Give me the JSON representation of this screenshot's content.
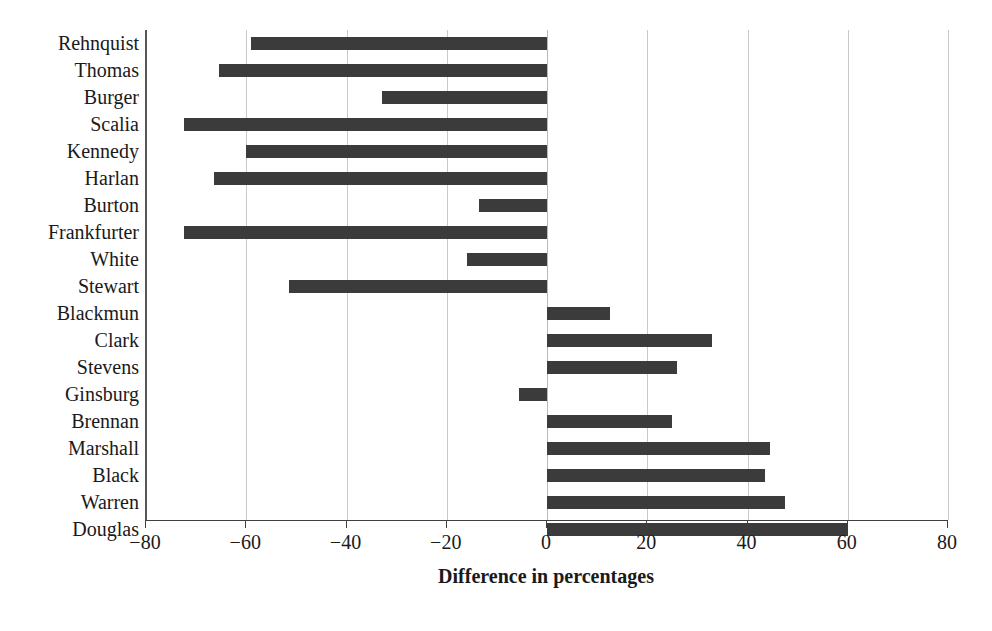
{
  "chart_data": {
    "type": "bar",
    "orientation": "horizontal",
    "title": "",
    "xlabel": "Difference in percentages",
    "ylabel": "",
    "xlim": [
      -80,
      80
    ],
    "xticks": [
      -80,
      -60,
      -40,
      -20,
      0,
      20,
      40,
      60,
      80
    ],
    "xtick_labels": [
      "−80",
      "−60",
      "−40",
      "−20",
      "0",
      "20",
      "40",
      "60",
      "80"
    ],
    "grid": "vertical",
    "legend": "none",
    "bar_color": "#3b3b3b",
    "categories": [
      "Rehnquist",
      "Thomas",
      "Burger",
      "Scalia",
      "Kennedy",
      "Harlan",
      "Burton",
      "Frankfurter",
      "White",
      "Stewart",
      "Blackmun",
      "Clark",
      "Stevens",
      "Ginsburg",
      "Brennan",
      "Marshall",
      "Black",
      "Warren",
      "Douglas"
    ],
    "values": [
      -59,
      -65.5,
      -33,
      -72.5,
      -60,
      -66.5,
      -13.5,
      -72.5,
      -16,
      -51.5,
      12.5,
      33,
      26,
      -5.5,
      25,
      44.5,
      43.5,
      47.5,
      60
    ]
  }
}
